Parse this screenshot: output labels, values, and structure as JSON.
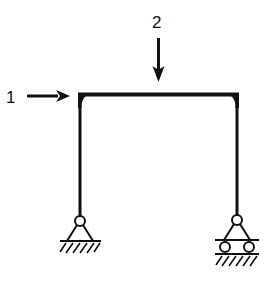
{
  "diagram": {
    "type": "portal-frame",
    "loads": [
      {
        "id": "load-1",
        "label": "1",
        "direction": "horizontal-right",
        "applied_at": "top-left-corner"
      },
      {
        "id": "load-2",
        "label": "2",
        "direction": "vertical-down",
        "applied_at": "beam-midspan"
      }
    ],
    "supports": [
      {
        "id": "left-support",
        "kind": "pin"
      },
      {
        "id": "right-support",
        "kind": "roller"
      }
    ],
    "colors": {
      "ink": "#111111",
      "background": "#ffffff"
    }
  }
}
